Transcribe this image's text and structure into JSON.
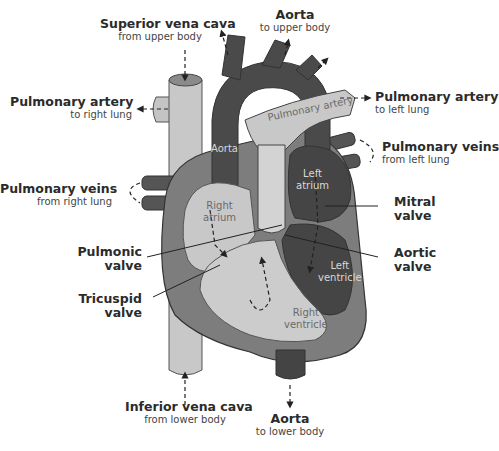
{
  "diagram": {
    "colors": {
      "background": "#ffffff",
      "deoxygenated_light": "#c8c8c8",
      "vein_tube": "#bdbdbd",
      "muscle_mid": "#8a8a8a",
      "oxygenated_dark": "#4a4a4a",
      "darkest": "#333333",
      "text": "#2b2b2b",
      "leader_line": "#222222"
    },
    "labels": {
      "superior_vena_cava": {
        "title": "Superior vena cava",
        "sub": "from upper body"
      },
      "aorta_upper": {
        "title": "Aorta",
        "sub": "to upper body"
      },
      "pulmonary_artery_right": {
        "title": "Pulmonary artery",
        "sub": "to right lung"
      },
      "pulmonary_artery_left": {
        "title": "Pulmonary artery",
        "sub": "to left lung"
      },
      "pulmonary_veins_left": {
        "title": "Pulmonary veins",
        "sub": "from left lung"
      },
      "pulmonary_veins_right": {
        "title": "Pulmonary veins",
        "sub": "from right lung"
      },
      "mitral_valve": {
        "title1": "Mitral",
        "title2": "valve"
      },
      "pulmonic_valve": {
        "title1": "Pulmonic",
        "title2": "valve"
      },
      "aortic_valve": {
        "title1": "Aortic",
        "title2": "valve"
      },
      "tricuspid_valve": {
        "title1": "Tricuspid",
        "title2": "valve"
      },
      "inferior_vena_cava": {
        "title": "Inferior vena cava",
        "sub": "from lower body"
      },
      "aorta_lower": {
        "title": "Aorta",
        "sub": "to lower body"
      }
    },
    "inner_labels": {
      "pulmonary_artery": "Pulmonary artery",
      "aorta": "Aorta",
      "left_atrium_1": "Left",
      "left_atrium_2": "atrium",
      "right_atrium_1": "Right",
      "right_atrium_2": "atrium",
      "left_ventricle_1": "Left",
      "left_ventricle_2": "ventricle",
      "right_ventricle_1": "Right",
      "right_ventricle_2": "ventricle"
    }
  }
}
